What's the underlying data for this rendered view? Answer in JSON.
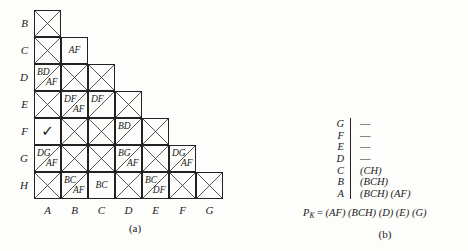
{
  "figure": {
    "caption_a": "(a)",
    "caption_b": "(b)"
  },
  "matrix": {
    "row_labels": [
      "B",
      "C",
      "D",
      "E",
      "F",
      "G",
      "H"
    ],
    "col_labels": [
      "A",
      "B",
      "C",
      "D",
      "E",
      "F",
      "G"
    ],
    "cell_size": 27,
    "check_glyph": "✓",
    "rows": [
      {
        "label": "B",
        "cells": [
          {
            "col": "A",
            "type": "x"
          }
        ]
      },
      {
        "label": "C",
        "cells": [
          {
            "col": "A",
            "type": "x"
          },
          {
            "col": "B",
            "type": "center",
            "center": "AF"
          }
        ]
      },
      {
        "label": "D",
        "cells": [
          {
            "col": "A",
            "type": "split",
            "ul": "BD",
            "lr": "AF"
          },
          {
            "col": "B",
            "type": "x"
          },
          {
            "col": "C",
            "type": "x"
          }
        ]
      },
      {
        "label": "E",
        "cells": [
          {
            "col": "A",
            "type": "x"
          },
          {
            "col": "B",
            "type": "split",
            "ul": "DF",
            "lr": "AF"
          },
          {
            "col": "C",
            "type": "split",
            "ul": "DF",
            "lr": ""
          },
          {
            "col": "D",
            "type": "x"
          }
        ]
      },
      {
        "label": "F",
        "cells": [
          {
            "col": "A",
            "type": "check"
          },
          {
            "col": "B",
            "type": "x"
          },
          {
            "col": "C",
            "type": "x"
          },
          {
            "col": "D",
            "type": "split",
            "ul": "BD",
            "lr": ""
          },
          {
            "col": "E",
            "type": "x"
          }
        ]
      },
      {
        "label": "G",
        "cells": [
          {
            "col": "A",
            "type": "split",
            "ul": "DG",
            "lr": "AF"
          },
          {
            "col": "B",
            "type": "x"
          },
          {
            "col": "C",
            "type": "x"
          },
          {
            "col": "D",
            "type": "split",
            "ul": "BG",
            "lr": "AF"
          },
          {
            "col": "E",
            "type": "x"
          },
          {
            "col": "F",
            "type": "split",
            "ul": "DG",
            "lr": "AF"
          }
        ]
      },
      {
        "label": "H",
        "cells": [
          {
            "col": "A",
            "type": "x"
          },
          {
            "col": "B",
            "type": "split",
            "ul": "BC",
            "lr": "AF"
          },
          {
            "col": "C",
            "type": "center",
            "center": "BC"
          },
          {
            "col": "D",
            "type": "x"
          },
          {
            "col": "E",
            "type": "split",
            "ul": "BC",
            "lr": "DF"
          },
          {
            "col": "F",
            "type": "x"
          },
          {
            "col": "G",
            "type": "x"
          }
        ]
      }
    ]
  },
  "plist": {
    "rows": [
      {
        "key": "G",
        "value": "—",
        "dash": true
      },
      {
        "key": "F",
        "value": "—",
        "dash": true
      },
      {
        "key": "E",
        "value": "—",
        "dash": true
      },
      {
        "key": "D",
        "value": "—",
        "dash": true
      },
      {
        "key": "C",
        "value": "(CH)",
        "dash": false
      },
      {
        "key": "B",
        "value": "(BCH)",
        "dash": false
      },
      {
        "key": "A",
        "value": "(BCH) (AF)",
        "dash": false
      }
    ],
    "formula_symbol": "P",
    "formula_subscript": "K",
    "formula_eq": " = ",
    "formula_value": "(AF) (BCH) (D) (E) (G)"
  }
}
